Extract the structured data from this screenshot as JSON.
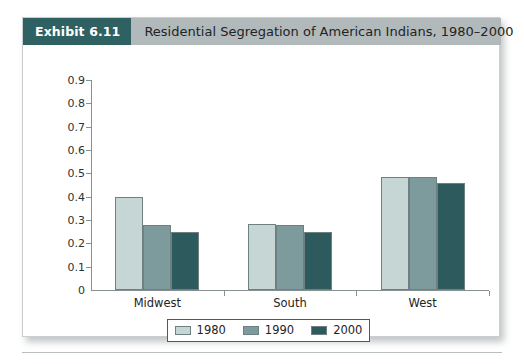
{
  "exhibit": {
    "badge_label": "Exhibit 6.11",
    "title": "Residential Segregation of American Indians, 1980–2000",
    "badge_color": "#2f6163",
    "header_bg": "#b2b9bb"
  },
  "chart_data": {
    "type": "bar",
    "title": "Residential Segregation of American Indians, 1980–2000",
    "xlabel": "",
    "ylabel": "",
    "categories": [
      "Midwest",
      "South",
      "West"
    ],
    "series": [
      {
        "name": "1980",
        "color": "#c6d6d4",
        "values": [
          0.4,
          0.285,
          0.485
        ]
      },
      {
        "name": "1990",
        "color": "#7d9a9d",
        "values": [
          0.28,
          0.28,
          0.485
        ]
      },
      {
        "name": "2000",
        "color": "#2d5a5c",
        "values": [
          0.25,
          0.25,
          0.46
        ]
      }
    ],
    "ylim": [
      0,
      0.9
    ],
    "yticks": [
      "0.9",
      "0.8",
      "0.7",
      "0.6",
      "0.5",
      "0.4",
      "0.3",
      "0.2",
      "0.1",
      "0"
    ],
    "ytick_values": [
      0.9,
      0.8,
      0.7,
      0.6,
      0.5,
      0.4,
      0.3,
      0.2,
      0.1,
      0
    ],
    "grid": false,
    "legend_position": "bottom",
    "legend_entries": [
      "1980",
      "1990",
      "2000"
    ]
  }
}
